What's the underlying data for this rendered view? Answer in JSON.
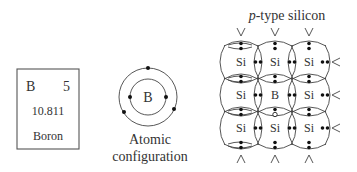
{
  "element_card": {
    "symbol": "B",
    "atomic_number": "5",
    "atomic_mass": "10.811",
    "name": "Boron"
  },
  "atomic_configuration": {
    "nucleus_label": "B",
    "caption_line1": "Atomic",
    "caption_line2": "configuration",
    "inner_shell_electrons": 2,
    "outer_shell_electrons": 3
  },
  "lattice": {
    "title_italic": "p",
    "title_rest": "-type silicon",
    "atoms": [
      [
        "Si",
        "Si",
        "Si"
      ],
      [
        "Si",
        "B",
        "Si"
      ],
      [
        "Si",
        "Si",
        "Si"
      ]
    ],
    "hole_note": "one bond below the B atom has an open circle (hole)"
  }
}
